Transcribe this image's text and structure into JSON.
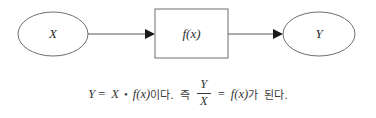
{
  "diagram": {
    "type": "flowchart",
    "nodes": [
      {
        "id": "input",
        "shape": "ellipse",
        "label": "X"
      },
      {
        "id": "function",
        "shape": "rectangle",
        "label": "f(x)"
      },
      {
        "id": "output",
        "shape": "ellipse",
        "label": "Y"
      }
    ],
    "edges": [
      {
        "from": "input",
        "to": "function",
        "arrow": "filled-triangle"
      },
      {
        "from": "function",
        "to": "output",
        "arrow": "filled-triangle"
      }
    ]
  },
  "caption": {
    "lhs_var": "Y",
    "equals_1": "=",
    "factor_var": "X",
    "bullet": "•",
    "function_expr": "f(x)",
    "text_ida": "이다.",
    "text_jeuk": "즉",
    "fraction_numerator": "Y",
    "fraction_denominator": "X",
    "equals_2": "=",
    "function_expr_2": "f(x)",
    "text_ga": "가",
    "text_doenda": "된다."
  },
  "colors": {
    "background": "#ffffff",
    "stroke": "#6e6e6e",
    "line": "#5a5a5a",
    "arrow": "#1a1a1a",
    "text": "#333333"
  }
}
